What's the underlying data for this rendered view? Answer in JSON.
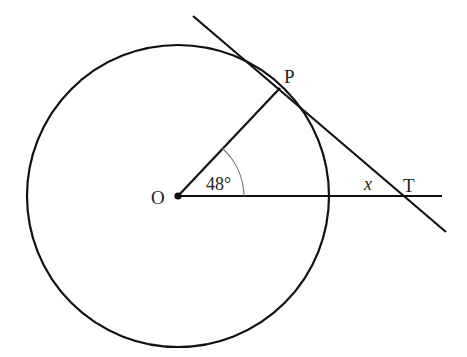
{
  "diagram": {
    "type": "circle-tangent-geometry",
    "labels": {
      "center": "O",
      "tangent_point": "P",
      "external_point": "T",
      "angle_at_center": "48°",
      "unknown_angle": "x"
    },
    "colors": {
      "line": "#111111",
      "arc": "#777777",
      "background": "#ffffff"
    }
  }
}
